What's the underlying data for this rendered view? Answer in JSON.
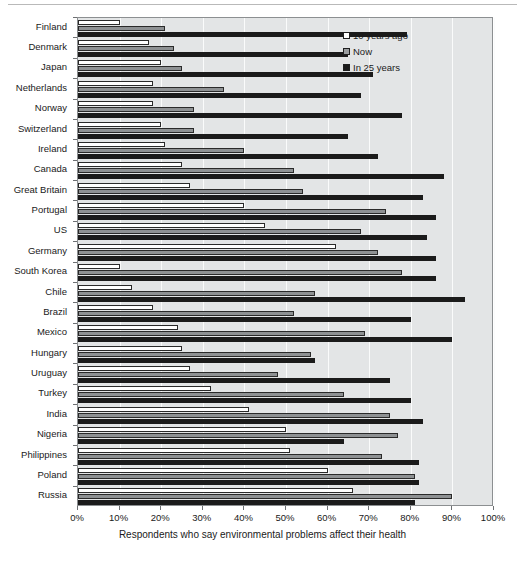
{
  "chart_data": {
    "type": "bar",
    "orientation": "horizontal",
    "title": "",
    "xlabel": "Respondents who say environmental problems affect their health",
    "ylabel": "",
    "xlim": [
      0,
      100
    ],
    "xticks": [
      "0%",
      "10%",
      "20%",
      "30%",
      "40%",
      "50%",
      "60%",
      "70%",
      "80%",
      "90%",
      "100%"
    ],
    "xtick_values": [
      0,
      10,
      20,
      30,
      40,
      50,
      60,
      70,
      80,
      90,
      100
    ],
    "grid": true,
    "legend_position": "top-right",
    "categories": [
      "Finland",
      "Denmark",
      "Japan",
      "Netherlands",
      "Norway",
      "Switzerland",
      "Ireland",
      "Canada",
      "Great Britain",
      "Portugal",
      "US",
      "Germany",
      "South Korea",
      "Chile",
      "Brazil",
      "Mexico",
      "Hungary",
      "Uruguay",
      "Turkey",
      "India",
      "Nigeria",
      "Philippines",
      "Poland",
      "Russia"
    ],
    "series": [
      {
        "name": "10 years ago",
        "color": "#ffffff",
        "values": [
          10,
          17,
          20,
          18,
          18,
          20,
          21,
          25,
          27,
          40,
          45,
          62,
          10,
          13,
          18,
          24,
          25,
          27,
          32,
          41,
          50,
          51,
          60,
          66
        ]
      },
      {
        "name": "Now",
        "color": "#8e9193",
        "values": [
          21,
          23,
          25,
          35,
          28,
          28,
          40,
          52,
          54,
          74,
          68,
          72,
          78,
          57,
          52,
          69,
          56,
          48,
          64,
          75,
          77,
          73,
          81,
          90
        ]
      },
      {
        "name": "In 25 years",
        "color": "#1b1b1b",
        "values": [
          79,
          65,
          71,
          68,
          78,
          65,
          72,
          88,
          83,
          86,
          84,
          86,
          86,
          93,
          80,
          90,
          57,
          75,
          80,
          83,
          64,
          82,
          82,
          81
        ]
      }
    ]
  },
  "legend": {
    "items": [
      {
        "label": "10 years ago",
        "swatch": "sw-white"
      },
      {
        "label": "Now",
        "swatch": "sw-gray"
      },
      {
        "label": "In 25 years",
        "swatch": "sw-black"
      }
    ]
  }
}
